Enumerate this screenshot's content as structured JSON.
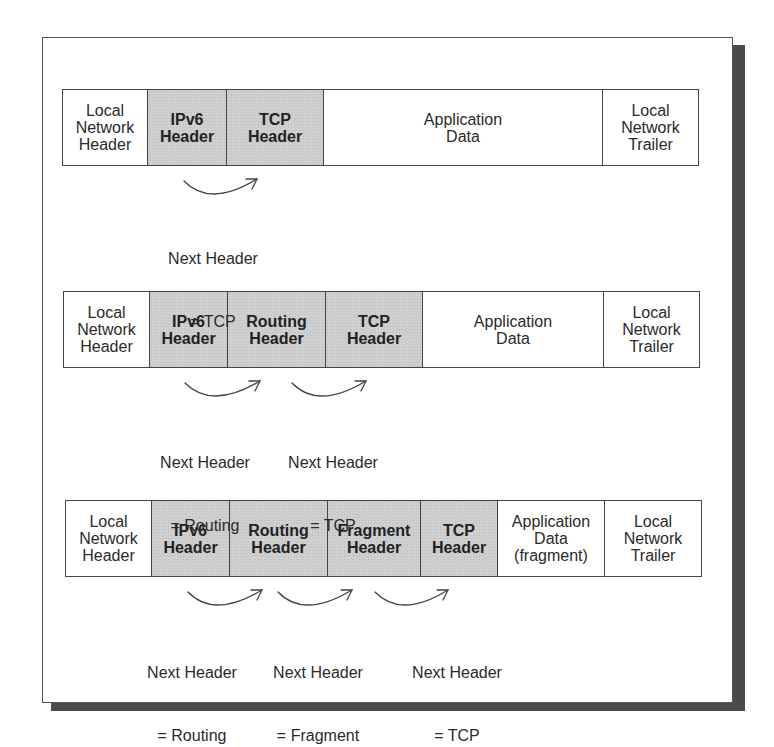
{
  "diagram": {
    "colors": {
      "shaded": "#cfcfcf",
      "border": "#444444",
      "shadow": "#4a4a4a",
      "text": "#2a2a2a"
    },
    "rows": [
      {
        "cells": [
          {
            "label": "Local\nNetwork\nHeader",
            "shaded": false
          },
          {
            "label": "IPv6\nHeader",
            "shaded": true
          },
          {
            "label": "TCP\nHeader",
            "shaded": true
          },
          {
            "label": "Application\nData",
            "shaded": false
          },
          {
            "label": "Local\nNetwork\nTrailer",
            "shaded": false
          }
        ],
        "annotations": [
          {
            "line1": "Next Header",
            "line2": "= TCP"
          }
        ]
      },
      {
        "cells": [
          {
            "label": "Local\nNetwork\nHeader",
            "shaded": false
          },
          {
            "label": "IPv6\nHeader",
            "shaded": true
          },
          {
            "label": "Routing\nHeader",
            "shaded": true
          },
          {
            "label": "TCP\nHeader",
            "shaded": true
          },
          {
            "label": "Application\nData",
            "shaded": false
          },
          {
            "label": "Local\nNetwork\nTrailer",
            "shaded": false
          }
        ],
        "annotations": [
          {
            "line1": "Next Header",
            "line2": "= Routing"
          },
          {
            "line1": "Next Header",
            "line2": "= TCP"
          }
        ]
      },
      {
        "cells": [
          {
            "label": "Local\nNetwork\nHeader",
            "shaded": false
          },
          {
            "label": "IPv6\nHeader",
            "shaded": true
          },
          {
            "label": "Routing\nHeader",
            "shaded": true
          },
          {
            "label": "Fragment\nHeader",
            "shaded": true
          },
          {
            "label": "TCP\nHeader",
            "shaded": true
          },
          {
            "label": "Application\nData\n(fragment)",
            "shaded": false
          },
          {
            "label": "Local\nNetwork\nTrailer",
            "shaded": false
          }
        ],
        "annotations": [
          {
            "line1": "Next Header",
            "line2": "= Routing"
          },
          {
            "line1": "Next Header",
            "line2": "= Fragment"
          },
          {
            "line1": "Next Header",
            "line2": "= TCP"
          }
        ]
      }
    ]
  }
}
